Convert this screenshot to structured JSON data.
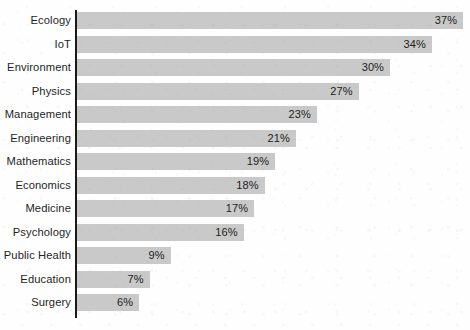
{
  "chart_data": {
    "type": "bar",
    "orientation": "horizontal",
    "title": "",
    "subtitle": "",
    "xlabel": "",
    "ylabel": "",
    "xlim": [
      0,
      37
    ],
    "grid": false,
    "legend": false,
    "legend_position": "none",
    "axis_ticks_visible": false,
    "value_label_suffix": "%",
    "value_label_position": "inside-end",
    "categories": [
      "Ecology",
      "IoT",
      "Environment",
      "Physics",
      "Management",
      "Engineering",
      "Mathematics",
      "Economics",
      "Medicine",
      "Psychology",
      "Public Health",
      "Education",
      "Surgery"
    ],
    "values": [
      37,
      34,
      30,
      27,
      23,
      21,
      19,
      18,
      17,
      16,
      9,
      7,
      6
    ],
    "value_labels": [
      "37%",
      "34%",
      "30%",
      "27%",
      "23%",
      "21%",
      "19%",
      "18%",
      "17%",
      "16%",
      "9%",
      "7%",
      "6%"
    ],
    "bars": [
      {
        "category": "Ecology",
        "value": 37,
        "label": "37%"
      },
      {
        "category": "IoT",
        "value": 34,
        "label": "34%"
      },
      {
        "category": "Environment",
        "value": 30,
        "label": "30%"
      },
      {
        "category": "Physics",
        "value": 27,
        "label": "27%"
      },
      {
        "category": "Management",
        "value": 23,
        "label": "23%"
      },
      {
        "category": "Engineering",
        "value": 21,
        "label": "21%"
      },
      {
        "category": "Mathematics",
        "value": 19,
        "label": "19%"
      },
      {
        "category": "Economics",
        "value": 18,
        "label": "18%"
      },
      {
        "category": "Medicine",
        "value": 17,
        "label": "17%"
      },
      {
        "category": "Psychology",
        "value": 16,
        "label": "16%"
      },
      {
        "category": "Public Health",
        "value": 9,
        "label": "9%"
      },
      {
        "category": "Education",
        "value": 7,
        "label": "7%"
      },
      {
        "category": "Surgery",
        "value": 6,
        "label": "6%"
      }
    ]
  },
  "style": {
    "bar_color": "#c9c9c9",
    "axis_color": "#1a1a1a",
    "label_color": "#1e1e1e",
    "value_color": "#1c1c1c",
    "background_color": "#fefefe"
  },
  "geometry": {
    "axis_x": 75,
    "axis_top": 10,
    "axis_bottom": 318,
    "bar_left": 76.5,
    "bar_height": 17,
    "row_pitch": 23.5,
    "px_per_unit": 10.45,
    "value_label_inset": 6
  }
}
